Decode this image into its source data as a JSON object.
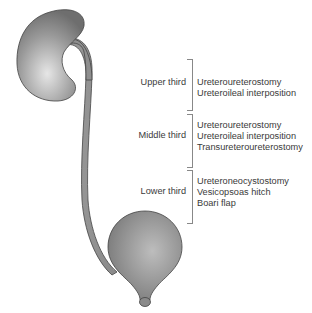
{
  "diagram": {
    "structures": [
      "kidney",
      "renal-pelvis",
      "ureter",
      "bladder",
      "urethra"
    ],
    "sections": [
      {
        "region": "Upper third",
        "procedures": [
          "Ureteroureterostomy",
          "Ureteroileal interposition"
        ]
      },
      {
        "region": "Middle third",
        "procedures": [
          "Ureteroureterostomy",
          "Ureteroileal interposition",
          "Transureteroureterostomy"
        ]
      },
      {
        "region": "Lower third",
        "procedures": [
          "Ureteroneocystostomy",
          "Vesicopsoas hitch",
          "Boari flap"
        ]
      }
    ],
    "colors": {
      "organ_fill": "#8c8c8c",
      "organ_highlight": "#d9d9d9",
      "outline": "#333333",
      "text": "#3a3a3a",
      "bracket": "#888888"
    }
  }
}
